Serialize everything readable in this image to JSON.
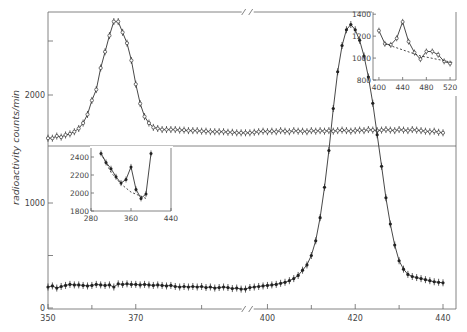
{
  "chart_data": {
    "type": "line",
    "ylabel": "radioactivity counts/min",
    "main": {
      "xlim": [
        350,
        441
      ],
      "x_ticks": [
        350,
        370,
        400,
        420,
        440
      ],
      "x_break_after": 395,
      "lower_panel": {
        "ylim": [
          0,
          1500
        ],
        "y_ticks": [
          0,
          500,
          1000
        ],
        "y_tick_labels": [
          "0",
          "",
          "1000"
        ],
        "marker": "filled",
        "series": {
          "name": "lower (filled markers)",
          "x": [
            350,
            351,
            352,
            353,
            354,
            355,
            356,
            357,
            358,
            359,
            360,
            361,
            362,
            363,
            364,
            365,
            366,
            367,
            368,
            369,
            370,
            371,
            372,
            373,
            374,
            375,
            376,
            377,
            378,
            379,
            380,
            381,
            382,
            383,
            384,
            385,
            386,
            387,
            388,
            389,
            390,
            391,
            392,
            393,
            394,
            395,
            396,
            397,
            398,
            399,
            400,
            401,
            402,
            403,
            404,
            405,
            406,
            407,
            408,
            409,
            410,
            411,
            412,
            413,
            414,
            415,
            416,
            417,
            418,
            419,
            420,
            421,
            422,
            423,
            424,
            425,
            426,
            427,
            428,
            429,
            430,
            431,
            432,
            433,
            434,
            435,
            436,
            437,
            438,
            439,
            440
          ],
          "y": [
            200,
            210,
            190,
            205,
            215,
            225,
            220,
            220,
            215,
            210,
            215,
            225,
            220,
            215,
            220,
            200,
            230,
            225,
            230,
            225,
            225,
            220,
            225,
            220,
            215,
            220,
            215,
            210,
            215,
            205,
            200,
            205,
            200,
            205,
            200,
            205,
            195,
            200,
            190,
            195,
            200,
            195,
            185,
            190,
            180,
            180,
            195,
            200,
            205,
            210,
            215,
            220,
            225,
            235,
            245,
            260,
            280,
            310,
            360,
            410,
            500,
            640,
            860,
            1150,
            1500,
            1900,
            2250,
            2500,
            2650,
            2700,
            2650,
            2550,
            2400,
            2200,
            1950,
            1650,
            1350,
            1050,
            800,
            600,
            450,
            370,
            320,
            300,
            290,
            280,
            270,
            260,
            250,
            245,
            240
          ]
        }
      },
      "upper_panel": {
        "ylim": [
          1500,
          2800
        ],
        "y_ticks": [
          1500,
          2000,
          2500
        ],
        "y_tick_labels": [
          "",
          "2000",
          ""
        ],
        "marker": "open",
        "series": {
          "name": "upper (open markers)",
          "x": [
            350,
            351,
            352,
            353,
            354,
            355,
            356,
            357,
            358,
            359,
            360,
            361,
            362,
            363,
            364,
            365,
            366,
            367,
            368,
            369,
            370,
            371,
            372,
            373,
            374,
            375,
            376,
            377,
            378,
            379,
            380,
            381,
            382,
            383,
            384,
            385,
            386,
            387,
            388,
            389,
            390,
            391,
            392,
            393,
            394,
            395,
            396,
            397,
            398,
            399,
            400,
            401,
            402,
            403,
            404,
            405,
            406,
            407,
            408,
            409,
            410,
            411,
            412,
            413,
            414,
            415,
            416,
            417,
            418,
            419,
            420,
            421,
            422,
            423,
            424,
            425,
            426,
            427,
            428,
            429,
            430,
            431,
            432,
            433,
            434,
            435,
            436,
            437,
            438,
            439,
            440
          ],
          "y": [
            1600,
            1600,
            1620,
            1610,
            1630,
            1640,
            1660,
            1690,
            1740,
            1820,
            1950,
            2050,
            2250,
            2400,
            2550,
            2680,
            2680,
            2580,
            2480,
            2320,
            2100,
            1920,
            1800,
            1740,
            1700,
            1690,
            1680,
            1680,
            1680,
            1680,
            1675,
            1675,
            1670,
            1670,
            1670,
            1665,
            1665,
            1660,
            1660,
            1660,
            1660,
            1655,
            1655,
            1650,
            1650,
            1650,
            1650,
            1655,
            1660,
            1665,
            1660,
            1665,
            1660,
            1670,
            1665,
            1660,
            1670,
            1665,
            1665,
            1660,
            1670,
            1665,
            1670,
            1665,
            1670,
            1665,
            1670,
            1675,
            1670,
            1665,
            1670,
            1675,
            1670,
            1680,
            1675,
            1670,
            1675,
            1680,
            1675,
            1670,
            1680,
            1675,
            1670,
            1680,
            1675,
            1670,
            1665,
            1660,
            1665,
            1655,
            1650
          ]
        }
      }
    },
    "inset_left": {
      "xlim": [
        280,
        440
      ],
      "ylim": [
        1800,
        2500
      ],
      "x_ticks": [
        280,
        360,
        440
      ],
      "y_ticks": [
        1800,
        2000,
        2200,
        2400
      ],
      "series": [
        {
          "name": "data",
          "style": "solid",
          "marker": "filled",
          "x": [
            300,
            310,
            320,
            330,
            340,
            350,
            360,
            370,
            380,
            390,
            400
          ],
          "y": [
            2440,
            2340,
            2270,
            2180,
            2110,
            2150,
            2290,
            2040,
            1940,
            1990,
            2440
          ]
        },
        {
          "name": "background",
          "style": "dashed",
          "x": [
            300,
            320,
            340,
            360,
            390
          ],
          "y": [
            2440,
            2230,
            2100,
            2010,
            1940
          ]
        }
      ]
    },
    "inset_right": {
      "xlim": [
        390,
        530
      ],
      "ylim": [
        800,
        1420
      ],
      "x_ticks": [
        400,
        440,
        480,
        520
      ],
      "y_ticks": [
        800,
        1000,
        1200,
        1400
      ],
      "series": [
        {
          "name": "data",
          "style": "solid",
          "marker": "open",
          "x": [
            400,
            410,
            420,
            430,
            440,
            450,
            460,
            470,
            480,
            490,
            500,
            510,
            520
          ],
          "y": [
            1250,
            1130,
            1120,
            1180,
            1330,
            1150,
            1050,
            990,
            1060,
            1060,
            1030,
            970,
            950
          ]
        },
        {
          "name": "background",
          "style": "dashed",
          "x": [
            410,
            470,
            525
          ],
          "y": [
            1130,
            1020,
            960
          ]
        }
      ]
    }
  },
  "labels": {
    "ylabel": "radioactivity counts/min",
    "x_tick_labels": [
      "350",
      "370",
      "400",
      "420",
      "440"
    ],
    "y_lower": {
      "t0": "0",
      "t1000": "1000"
    },
    "y_upper": {
      "t2000": "2000"
    },
    "inset_left": {
      "x": [
        "280",
        "360",
        "440"
      ],
      "y": [
        "1800",
        "2000",
        "2200",
        "2400"
      ]
    },
    "inset_right": {
      "x": [
        "400",
        "440",
        "480",
        "520"
      ],
      "y": [
        "800",
        "1000",
        "1200",
        "1400"
      ]
    }
  }
}
